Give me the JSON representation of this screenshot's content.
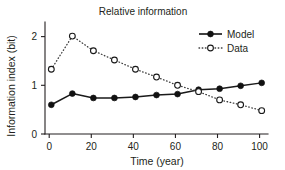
{
  "chart_data": {
    "type": "line",
    "title": "Relative information",
    "xlabel": "Time (year)",
    "ylabel": "Information index (bit)",
    "x": [
      1,
      11,
      21,
      31,
      41,
      51,
      61,
      71,
      81,
      91,
      101
    ],
    "xlim": [
      -2,
      104
    ],
    "ylim": [
      0,
      2.3
    ],
    "xticks": [
      0,
      20,
      40,
      60,
      80,
      100
    ],
    "yticks": [
      0,
      1,
      2
    ],
    "xtick_labels": [
      "0",
      "20",
      "40",
      "60",
      "80",
      "100"
    ],
    "ytick_labels": [
      "0",
      "1",
      "2"
    ],
    "grid": false,
    "legend_position": "top-right",
    "series": [
      {
        "name": "Model",
        "style": "solid",
        "marker": "filled-circle",
        "color": "#111111",
        "values": [
          0.6,
          0.83,
          0.74,
          0.74,
          0.76,
          0.8,
          0.82,
          0.91,
          0.93,
          0.99,
          1.05
        ]
      },
      {
        "name": "Data",
        "style": "dotted",
        "marker": "open-circle",
        "color": "#1a1a1a",
        "values": [
          1.33,
          2.01,
          1.71,
          1.52,
          1.33,
          1.17,
          1.0,
          0.87,
          0.7,
          0.6,
          0.48
        ]
      }
    ]
  },
  "legend": {
    "entries": [
      {
        "label": "Model"
      },
      {
        "label": "Data"
      }
    ]
  }
}
